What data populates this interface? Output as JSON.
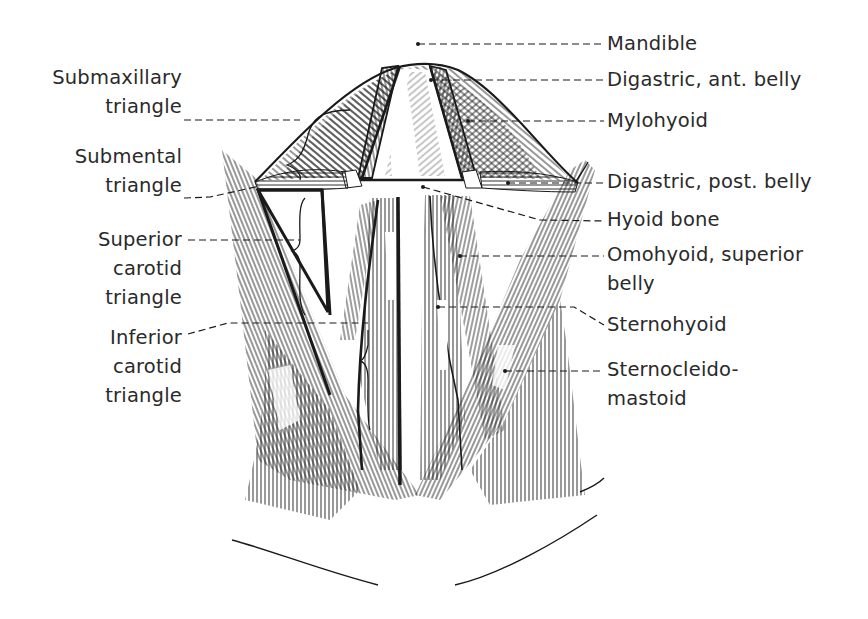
{
  "figure": {
    "ink_color": "#1a1a1a",
    "label_color": "#2a2a2a",
    "background": "#ffffff"
  },
  "labels": {
    "left": [
      {
        "id": "submaxillary-triangle",
        "lines": [
          "Submaxillary",
          "triangle"
        ]
      },
      {
        "id": "submental-triangle",
        "lines": [
          "Submental",
          "triangle"
        ]
      },
      {
        "id": "superior-carotid-triangle",
        "lines": [
          "Superior",
          "carotid",
          "triangle"
        ]
      },
      {
        "id": "inferior-carotid-triangle",
        "lines": [
          "Inferior",
          "carotid",
          "triangle"
        ]
      }
    ],
    "right": [
      {
        "id": "mandible",
        "lines": [
          "Mandible"
        ]
      },
      {
        "id": "digastric-ant-belly",
        "lines": [
          "Digastric, ant. belly"
        ]
      },
      {
        "id": "mylohyoid",
        "lines": [
          "Mylohyoid"
        ]
      },
      {
        "id": "digastric-post-belly",
        "lines": [
          "Digastric, post. belly"
        ]
      },
      {
        "id": "hyoid-bone",
        "lines": [
          "Hyoid bone"
        ]
      },
      {
        "id": "omohyoid-superior-belly",
        "lines": [
          "Omohyoid, superior",
          "belly"
        ]
      },
      {
        "id": "sternohyoid",
        "lines": [
          "Sternohyoid"
        ]
      },
      {
        "id": "sternocleidomastoid",
        "lines": [
          "Sternocleido-",
          "mastoid"
        ]
      }
    ]
  }
}
